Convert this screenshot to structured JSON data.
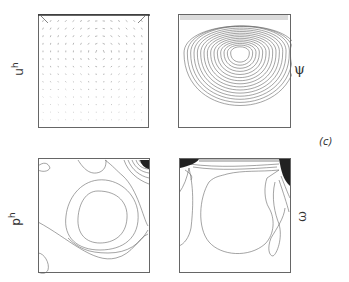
{
  "figure": {
    "panel_label": "(c)",
    "line_color": "#555555",
    "frame_color": "#666666",
    "panels": [
      {
        "id": "velocity",
        "label_base": "u",
        "label_sup": "h",
        "label_vector": "→",
        "description": "velocity vector field"
      },
      {
        "id": "streamfunction",
        "label": "ψ",
        "description": "stream function contours"
      },
      {
        "id": "pressure",
        "label_base": "p",
        "label_sup": "h",
        "description": "pressure contours"
      },
      {
        "id": "vorticity",
        "label": "ω",
        "description": "vorticity contours"
      }
    ]
  }
}
